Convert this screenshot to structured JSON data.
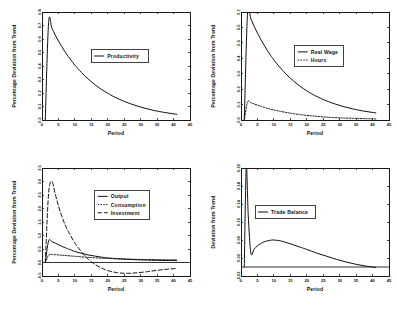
{
  "figure": {
    "background": "#ffffff",
    "ink": "#111111",
    "panel_count": 4
  },
  "chart_data": [
    {
      "id": "productivity",
      "type": "line",
      "title": "",
      "xlabel": "Period",
      "ylabel": "Percentage Deviation from Trend",
      "xlim": [
        0,
        45
      ],
      "ylim": [
        0.0,
        0.8
      ],
      "xticks": [
        0,
        5,
        10,
        15,
        20,
        25,
        30,
        35,
        40,
        45
      ],
      "xtick_labels": [
        "0",
        "5",
        "10",
        "15",
        "20",
        "25",
        "30",
        "35",
        "40",
        "45"
      ],
      "yticks": [
        0.0,
        0.1,
        0.2,
        0.3,
        0.4,
        0.5,
        0.6,
        0.7,
        0.8
      ],
      "ytick_labels": [
        "0.0",
        "0.1",
        "0.2",
        "0.3",
        "0.4",
        "0.5",
        "0.6",
        "0.7",
        "0.8"
      ],
      "grid": false,
      "legend_position": "center",
      "series": [
        {
          "name": "Productivity",
          "style": "solid",
          "x": [
            1,
            2,
            3,
            4,
            5,
            6,
            7,
            8,
            9,
            10,
            12,
            14,
            16,
            18,
            20,
            22,
            25,
            28,
            31,
            34,
            37,
            41
          ],
          "values": [
            0.0,
            0.72,
            0.68,
            0.63,
            0.585,
            0.545,
            0.505,
            0.47,
            0.437,
            0.406,
            0.352,
            0.305,
            0.264,
            0.228,
            0.198,
            0.171,
            0.138,
            0.111,
            0.089,
            0.071,
            0.057,
            0.042
          ]
        }
      ]
    },
    {
      "id": "labor",
      "type": "line",
      "title": "",
      "xlabel": "Period",
      "ylabel": "Percentage Deviation from Trend",
      "xlim": [
        0,
        45
      ],
      "ylim": [
        0.0,
        0.7
      ],
      "xticks": [
        0,
        5,
        10,
        15,
        20,
        25,
        30,
        35,
        40,
        45
      ],
      "xtick_labels": [
        "0",
        "5",
        "10",
        "15",
        "20",
        "25",
        "30",
        "35",
        "40",
        "45"
      ],
      "yticks": [
        0.0,
        0.1,
        0.2,
        0.3,
        0.4,
        0.5,
        0.6,
        0.7
      ],
      "ytick_labels": [
        "0.0",
        "0.1",
        "0.2",
        "0.3",
        "0.4",
        "0.5",
        "0.6",
        "0.7"
      ],
      "grid": false,
      "legend_position": "center",
      "series": [
        {
          "name": "Real Wage",
          "style": "solid",
          "x": [
            1,
            2,
            3,
            4,
            5,
            6,
            7,
            8,
            9,
            10,
            12,
            14,
            16,
            18,
            20,
            22,
            25,
            28,
            31,
            34,
            37,
            41
          ],
          "values": [
            0.0,
            0.7,
            0.655,
            0.607,
            0.563,
            0.523,
            0.486,
            0.451,
            0.419,
            0.389,
            0.337,
            0.291,
            0.252,
            0.218,
            0.189,
            0.164,
            0.133,
            0.108,
            0.088,
            0.072,
            0.059,
            0.046
          ]
        },
        {
          "name": "Hours",
          "style": "dotted",
          "x": [
            1,
            2,
            3,
            4,
            5,
            6,
            7,
            8,
            9,
            10,
            12,
            14,
            16,
            18,
            20,
            22,
            25,
            28,
            31,
            34,
            37,
            41
          ],
          "values": [
            0.0,
            0.118,
            0.112,
            0.104,
            0.096,
            0.089,
            0.082,
            0.076,
            0.07,
            0.065,
            0.056,
            0.048,
            0.041,
            0.035,
            0.03,
            0.026,
            0.02,
            0.016,
            0.013,
            0.011,
            0.009,
            0.007
          ]
        }
      ]
    },
    {
      "id": "aggregates",
      "type": "line",
      "title": "",
      "xlabel": "Period",
      "ylabel": "Percentage Deviation from Trend",
      "xlim": [
        0,
        45
      ],
      "ylim": [
        -0.5,
        3.5
      ],
      "xticks": [
        0,
        5,
        10,
        15,
        20,
        25,
        30,
        35,
        40,
        45
      ],
      "xtick_labels": [
        "0",
        "5",
        "10",
        "15",
        "20",
        "25",
        "30",
        "35",
        "40",
        "45"
      ],
      "yticks": [
        -0.5,
        0.0,
        0.5,
        1.0,
        1.5,
        2.0,
        2.5,
        3.0,
        3.5
      ],
      "ytick_labels": [
        "-0.5",
        "0.0",
        "0.5",
        "1.0",
        "1.5",
        "2.0",
        "2.5",
        "3.0",
        "3.5"
      ],
      "grid": false,
      "zero_line": 0.0,
      "legend_position": "upper center",
      "series": [
        {
          "name": "Output",
          "style": "solid",
          "x": [
            1,
            2,
            3,
            4,
            5,
            6,
            7,
            8,
            10,
            12,
            14,
            16,
            18,
            20,
            23,
            26,
            29,
            32,
            35,
            38,
            41
          ],
          "values": [
            0.0,
            0.8,
            0.77,
            0.72,
            0.66,
            0.6,
            0.55,
            0.5,
            0.41,
            0.34,
            0.28,
            0.24,
            0.2,
            0.17,
            0.14,
            0.12,
            0.1,
            0.09,
            0.08,
            0.075,
            0.07
          ]
        },
        {
          "name": "Consumption",
          "style": "dotted",
          "x": [
            1,
            2,
            3,
            4,
            5,
            6,
            8,
            10,
            12,
            14,
            16,
            18,
            20,
            23,
            26,
            29,
            32,
            35,
            38,
            41
          ],
          "values": [
            0.0,
            0.27,
            0.29,
            0.29,
            0.28,
            0.27,
            0.25,
            0.23,
            0.21,
            0.19,
            0.175,
            0.16,
            0.15,
            0.135,
            0.125,
            0.115,
            0.11,
            0.105,
            0.1,
            0.1
          ]
        },
        {
          "name": "Investment",
          "style": "dashed",
          "x": [
            1,
            2,
            3,
            4,
            5,
            6,
            7,
            8,
            10,
            12,
            14,
            16,
            18,
            20,
            23,
            26,
            29,
            32,
            35,
            38,
            41
          ],
          "values": [
            0.0,
            2.55,
            3.0,
            2.55,
            2.1,
            1.72,
            1.4,
            1.15,
            0.72,
            0.4,
            0.13,
            -0.06,
            -0.2,
            -0.3,
            -0.38,
            -0.4,
            -0.38,
            -0.34,
            -0.29,
            -0.25,
            -0.22
          ]
        }
      ]
    },
    {
      "id": "trade",
      "type": "line",
      "title": "",
      "xlabel": "Period",
      "ylabel": "Deviation from Trend",
      "xlim": [
        0,
        45
      ],
      "ylim": [
        -0.02,
        0.22
      ],
      "xticks": [
        0,
        5,
        10,
        15,
        20,
        25,
        30,
        35,
        40,
        45
      ],
      "xtick_labels": [
        "0",
        "5",
        "10",
        "15",
        "20",
        "25",
        "30",
        "35",
        "40",
        "45"
      ],
      "yticks": [
        -0.02,
        0.02,
        0.06,
        0.1,
        0.14,
        0.18,
        0.22
      ],
      "ytick_labels": [
        "-0.02",
        "0.02",
        "0.06",
        "0.10",
        "0.14",
        "0.18",
        "0.22"
      ],
      "grid": false,
      "zero_line": 0.0,
      "legend_position": "center left",
      "series": [
        {
          "name": "Trade Balance",
          "style": "solid",
          "x": [
            1,
            1.6,
            2.2,
            3,
            4,
            5,
            6,
            7,
            8,
            9,
            10,
            12,
            14,
            16,
            18,
            20,
            23,
            26,
            29,
            32,
            35,
            38,
            41
          ],
          "values": [
            0.0,
            0.222,
            0.115,
            0.031,
            0.04,
            0.047,
            0.052,
            0.056,
            0.058,
            0.0595,
            0.06,
            0.058,
            0.054,
            0.049,
            0.044,
            0.039,
            0.031,
            0.024,
            0.017,
            0.011,
            0.006,
            0.002,
            -0.001
          ]
        }
      ]
    }
  ]
}
